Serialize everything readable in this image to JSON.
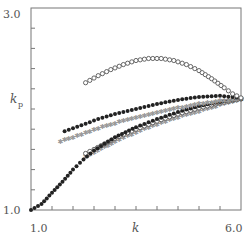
{
  "chart_data": {
    "type": "scatter",
    "title": "",
    "xlabel": "k",
    "ylabel": "k",
    "ylabel_subscript": "p",
    "xlim": [
      1.0,
      6.0
    ],
    "ylim": [
      1.0,
      3.0
    ],
    "x_tick_labels": [
      {
        "value": 1.0,
        "label": "1.0"
      },
      {
        "value": 6.0,
        "label": "6.0"
      }
    ],
    "y_tick_labels": [
      {
        "value": 1.0,
        "label": "1.0"
      },
      {
        "value": 3.0,
        "label": "3.0"
      }
    ],
    "x_minor_tick_step": 0.5,
    "y_minor_tick_step": 0.2,
    "grid": false,
    "legend": null,
    "series": [
      {
        "name": "open-circles-upper",
        "marker": "open-circle",
        "color": "#555555",
        "x": [
          2.3,
          2.6,
          2.9,
          3.2,
          3.5,
          3.8,
          4.1,
          4.4,
          4.7,
          5.0,
          5.3,
          5.6,
          5.8,
          6.0
        ],
        "y": [
          2.26,
          2.33,
          2.39,
          2.44,
          2.48,
          2.5,
          2.5,
          2.48,
          2.44,
          2.38,
          2.3,
          2.21,
          2.15,
          2.11
        ]
      },
      {
        "name": "filled-dots-upper",
        "marker": "filled-circle",
        "color": "#222222",
        "x": [
          1.8,
          2.2,
          2.6,
          3.0,
          3.5,
          4.0,
          4.5,
          5.0,
          5.5,
          6.0
        ],
        "y": [
          1.78,
          1.84,
          1.9,
          1.95,
          2.0,
          2.05,
          2.09,
          2.12,
          2.13,
          2.11
        ]
      },
      {
        "name": "gray-stars-upper",
        "marker": "star",
        "color": "#999999",
        "x": [
          1.7,
          2.2,
          2.6,
          3.0,
          3.5,
          4.0,
          4.5,
          5.0,
          5.5,
          6.0
        ],
        "y": [
          1.68,
          1.75,
          1.81,
          1.86,
          1.92,
          1.97,
          2.01,
          2.05,
          2.08,
          2.1
        ]
      },
      {
        "name": "filled-dots-lower",
        "marker": "filled-circle",
        "color": "#222222",
        "x": [
          1.0,
          1.25,
          1.5,
          1.75,
          2.0,
          2.25,
          2.5,
          3.0,
          3.5,
          4.0,
          4.5,
          5.0,
          5.5,
          6.0
        ],
        "y": [
          1.0,
          1.06,
          1.17,
          1.28,
          1.4,
          1.5,
          1.59,
          1.72,
          1.82,
          1.9,
          1.97,
          2.03,
          2.07,
          2.1
        ]
      },
      {
        "name": "open-circles-lower",
        "marker": "open-circle",
        "color": "#555555",
        "x": [
          2.3,
          2.5,
          3.0,
          3.5,
          4.0,
          4.5,
          5.0,
          5.5,
          6.0
        ],
        "y": [
          1.56,
          1.6,
          1.71,
          1.8,
          1.88,
          1.95,
          2.01,
          2.06,
          2.1
        ]
      },
      {
        "name": "gray-stars-lower",
        "marker": "star",
        "color": "#999999",
        "x": [
          2.3,
          2.5,
          3.0,
          3.5,
          4.0,
          4.5,
          5.0,
          5.5,
          6.0
        ],
        "y": [
          1.53,
          1.57,
          1.68,
          1.77,
          1.85,
          1.92,
          1.98,
          2.04,
          2.09
        ]
      }
    ]
  }
}
